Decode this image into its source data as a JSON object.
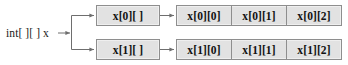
{
  "diagram": {
    "variable": {
      "label": "int[ ][ ] x"
    },
    "reference_boxes": [
      {
        "label": "x[0][ ]"
      },
      {
        "label": "x[1][ ]"
      }
    ],
    "array_rows": [
      {
        "cells": [
          {
            "label": "x[0][0]"
          },
          {
            "label": "x[0][1]"
          },
          {
            "label": "x[0][2]"
          }
        ]
      },
      {
        "cells": [
          {
            "label": "x[1][0]"
          },
          {
            "label": "x[1][1]"
          },
          {
            "label": "x[1][2]"
          }
        ]
      }
    ],
    "colors": {
      "box_fill": "#e2e2e2",
      "box_border": "#8e8e8e",
      "connector": "#6e6e6e",
      "text": "#111111",
      "background": "#ffffff"
    },
    "connectors": [
      {
        "name": "variable-to-junction"
      },
      {
        "name": "junction-to-ref-box-0"
      },
      {
        "name": "junction-to-ref-box-1"
      },
      {
        "name": "ref-box-0-to-array-row-0"
      },
      {
        "name": "ref-box-1-to-array-row-1"
      }
    ]
  }
}
